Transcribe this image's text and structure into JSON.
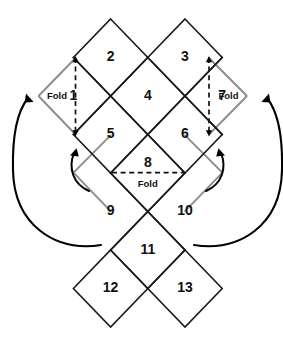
{
  "figure": {
    "background_color": "#ffffff",
    "edge_color": "#1a1a1a",
    "fold_edge_color": "#8c8c8c",
    "dash_color": "#111111",
    "arrow_color": "#000000",
    "text_color": "#111111"
  },
  "grid": {
    "origin_x": 147.8,
    "origin_y": 19.0,
    "half_width": 37.2,
    "half_height": 38.5,
    "cell_count": 13
  },
  "cells": [
    {
      "label": "1",
      "col": -1,
      "row": 2,
      "cx": 73.4,
      "cy": 96.0
    },
    {
      "label": "2",
      "col": 0,
      "row": 1,
      "cx": 110.6,
      "cy": 57.5
    },
    {
      "label": "3",
      "col": 2,
      "row": 1,
      "cx": 185.0,
      "cy": 57.5
    },
    {
      "label": "4",
      "col": 1,
      "row": 2,
      "cx": 147.8,
      "cy": 96.0
    },
    {
      "label": "5",
      "col": 0,
      "row": 3,
      "cx": 110.6,
      "cy": 134.5
    },
    {
      "label": "6",
      "col": 2,
      "row": 3,
      "cx": 185.0,
      "cy": 134.5
    },
    {
      "label": "7",
      "col": 3,
      "row": 2,
      "cx": 222.2,
      "cy": 96.0
    },
    {
      "label": "8",
      "col": 1,
      "row": 4,
      "cx": 147.8,
      "cy": 171.5
    },
    {
      "label": "9",
      "col": 0,
      "row": 5,
      "cx": 110.6,
      "cy": 211.5
    },
    {
      "label": "10",
      "col": 2,
      "row": 5,
      "cx": 185.0,
      "cy": 211.5
    },
    {
      "label": "11",
      "col": 1,
      "row": 6,
      "cx": 147.8,
      "cy": 250.0
    },
    {
      "label": "12",
      "col": 0,
      "row": 7,
      "cx": 110.6,
      "cy": 288.5
    },
    {
      "label": "13",
      "col": 2,
      "row": 7,
      "cx": 185.0,
      "cy": 288.5
    }
  ],
  "fold_labels": [
    {
      "id": "fold-left",
      "text": "Fold",
      "x": 57.0,
      "y": 96.0
    },
    {
      "id": "fold-right",
      "text": "Fold",
      "x": 239.0,
      "y": 96.0
    },
    {
      "id": "fold-center",
      "text": "Fold",
      "x": 147.8,
      "y": 184.5
    }
  ],
  "fold_dashed_lines": [
    {
      "id": "dash-left",
      "x1": 75.5,
      "y1": 58.0,
      "x2": 75.5,
      "y2": 134.5,
      "orientation": "vertical"
    },
    {
      "id": "dash-right",
      "x1": 209.0,
      "y1": 58.0,
      "x2": 209.0,
      "y2": 134.5,
      "orientation": "vertical"
    },
    {
      "id": "dash-center",
      "x1": 112.0,
      "y1": 172.6,
      "x2": 184.0,
      "y2": 172.6,
      "orientation": "horizontal"
    }
  ],
  "fold_flap_edges": [
    {
      "id": "flap-left-upper",
      "x1": 75.5,
      "y1": 58.0,
      "x2": 38.5,
      "y2": 96.0
    },
    {
      "id": "flap-left-lower",
      "x1": 38.5,
      "y1": 96.0,
      "x2": 75.5,
      "y2": 134.5
    },
    {
      "id": "flap-right-upper",
      "x1": 209.0,
      "y1": 58.0,
      "x2": 247.0,
      "y2": 96.0
    },
    {
      "id": "flap-right-lower",
      "x1": 247.0,
      "y1": 96.0,
      "x2": 209.0,
      "y2": 134.5
    },
    {
      "id": "flap-nine-upper",
      "x1": 111.0,
      "y1": 134.8,
      "x2": 73.5,
      "y2": 172.6
    },
    {
      "id": "flap-nine-lower",
      "x1": 73.5,
      "y1": 172.6,
      "x2": 111.0,
      "y2": 211.6
    },
    {
      "id": "flap-ten-upper",
      "x1": 184.6,
      "y1": 134.8,
      "x2": 222.4,
      "y2": 172.6
    },
    {
      "id": "flap-ten-lower",
      "x1": 222.4,
      "y1": 172.6,
      "x2": 184.6,
      "y2": 211.6
    }
  ],
  "arrows": [
    {
      "id": "arrow-outer-left",
      "direction": "counterclockwise",
      "from": "bottom-left of cell 9",
      "to": "left Fold flap"
    },
    {
      "id": "arrow-outer-right",
      "direction": "clockwise",
      "from": "bottom-right of cell 10",
      "to": "right Fold flap"
    },
    {
      "id": "arrow-inner-left",
      "direction": "counterclockwise",
      "from": "below cell 9",
      "to": "cell 5 edge"
    },
    {
      "id": "arrow-inner-right",
      "direction": "clockwise",
      "from": "below cell 10",
      "to": "cell 6 edge"
    }
  ]
}
